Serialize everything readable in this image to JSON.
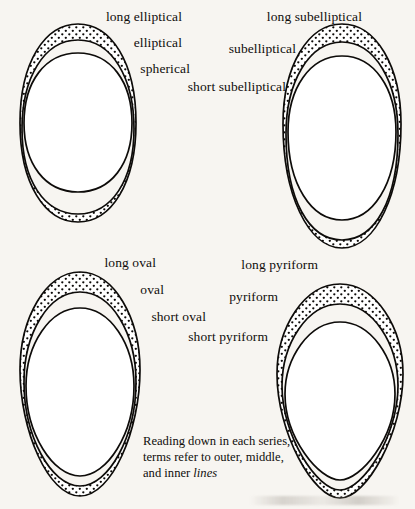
{
  "figure": {
    "background_color": "#f7f5f1",
    "ink_color": "#0d0b09",
    "caption_lines": [
      "Reading down in each series,",
      "terms refer to outer, middle,",
      "and inner "
    ],
    "caption_italic_word": "lines"
  },
  "series": [
    {
      "id": "elliptical",
      "name": "elliptical-series",
      "labels": [
        {
          "text": "long elliptical",
          "refers_to": "outer line"
        },
        {
          "text": "elliptical",
          "refers_to": "middle line"
        },
        {
          "text": "spherical",
          "refers_to": "inner line"
        }
      ]
    },
    {
      "id": "subelliptical",
      "name": "subelliptical-series",
      "labels": [
        {
          "text": "long subelliptical",
          "refers_to": "outer line"
        },
        {
          "text": "subelliptical",
          "refers_to": "middle line"
        },
        {
          "text": "short subelliptical",
          "refers_to": "inner line"
        }
      ]
    },
    {
      "id": "oval",
      "name": "oval-series",
      "labels": [
        {
          "text": "long oval",
          "refers_to": "outer line"
        },
        {
          "text": "oval",
          "refers_to": "middle line"
        },
        {
          "text": "short oval",
          "refers_to": "inner line"
        }
      ]
    },
    {
      "id": "pyriform",
      "name": "pyriform-series",
      "labels": [
        {
          "text": "long pyriform",
          "refers_to": "outer line"
        },
        {
          "text": "pyriform",
          "refers_to": "middle line"
        },
        {
          "text": "short pyriform",
          "refers_to": "inner line"
        }
      ]
    }
  ]
}
